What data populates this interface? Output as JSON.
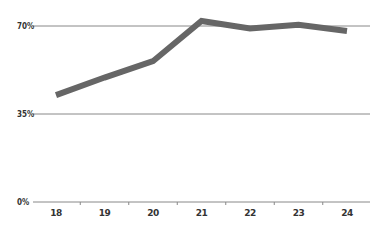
{
  "chart_data": {
    "type": "line",
    "title": "",
    "xlabel": "",
    "ylabel": "",
    "categories": [
      "18",
      "19",
      "20",
      "21",
      "22",
      "23",
      "24"
    ],
    "series": [
      {
        "name": "value",
        "values": [
          42.5,
          49.5,
          56,
          72,
          69,
          70.5,
          68
        ],
        "color": "#666666"
      }
    ],
    "ylim": [
      0,
      72
    ],
    "yticks": [
      0,
      35,
      70
    ],
    "ytick_labels": [
      "0%",
      "35%",
      "70%"
    ],
    "grid": true,
    "legend": false
  },
  "colors": {
    "line": "#666666",
    "grid": "#888888",
    "text": "#333333"
  }
}
